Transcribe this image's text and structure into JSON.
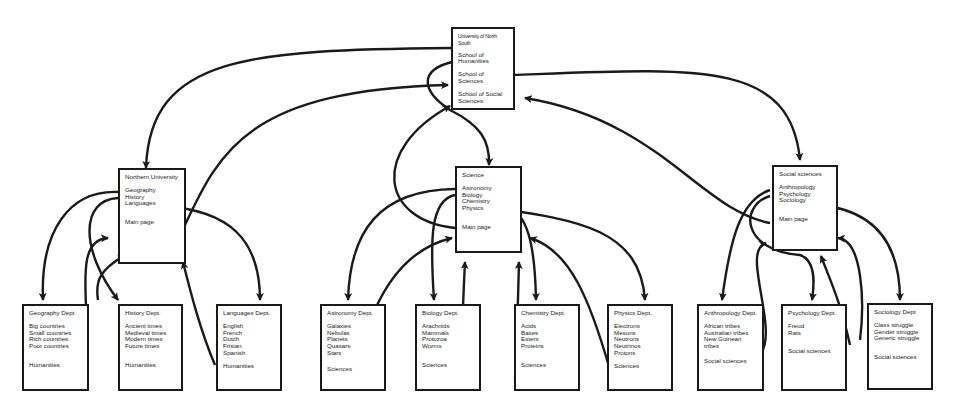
{
  "diagram": {
    "top": {
      "title": "University of North South",
      "items": [
        "School of Humanities",
        "School of Sciences",
        "School of Social Sciences"
      ]
    },
    "schools": [
      {
        "title": "Northern University",
        "items": [
          "Geography",
          "History",
          "Languages"
        ],
        "link": "Main page"
      },
      {
        "title": "Science",
        "items": [
          "Astronomy",
          "Biology",
          "Chemistry",
          "Physics"
        ],
        "link": "Main page"
      },
      {
        "title": "Social sciences",
        "items": [
          "Anthropology",
          "Psychology",
          "Sociology"
        ],
        "link": "Main page"
      }
    ],
    "departments": [
      {
        "title": "Geography Dept",
        "items": [
          "Big countries",
          "Small countries",
          "Rich countries",
          "Poor countries"
        ],
        "link": "Humanities"
      },
      {
        "title": "History Dept.",
        "items": [
          "Ancient times",
          "Medieval times",
          "Modern times",
          "Future times"
        ],
        "link": "Humanities"
      },
      {
        "title": "Languages Dept.",
        "items": [
          "English",
          "French",
          "Dutch",
          "Frisian",
          "Spanish"
        ],
        "link": "Humanities"
      },
      {
        "title": "Astronomy Dept.",
        "items": [
          "Galaxies",
          "Nebulas",
          "Planets",
          "Quasars",
          "Stars"
        ],
        "link": "Sciences"
      },
      {
        "title": "Biology Dept.",
        "items": [
          "Arachnids",
          "Mammals",
          "Protozoa",
          "Worms"
        ],
        "link": "Sciences"
      },
      {
        "title": "Chemistry Dept.",
        "items": [
          "Acids",
          "Bases",
          "Esters",
          "Proteins"
        ],
        "link": "Sciences"
      },
      {
        "title": "Physics Dept.",
        "items": [
          "Electrons",
          "Mesons",
          "Neutrons",
          "Neutrinos",
          "Protons"
        ],
        "link": "Sciences"
      },
      {
        "title": "Anthropology Dept.",
        "items": [
          "African tribes",
          "Australian tribes",
          "New Guinean tribes"
        ],
        "link": "Social sciences"
      },
      {
        "title": "Psychology Dept.",
        "items": [
          "Freud",
          "Rats"
        ],
        "link": "Social sciences"
      },
      {
        "title": "Sociology Dept",
        "items": [
          "Class struggle",
          "Gender struggle",
          "Generic struggle"
        ],
        "link": "Social sciences"
      }
    ]
  }
}
